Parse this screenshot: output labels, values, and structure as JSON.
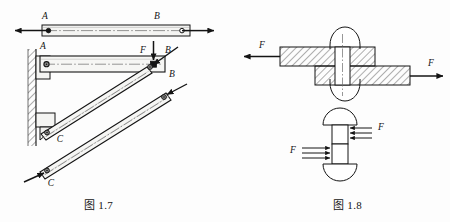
{
  "page": {
    "background": "#fdfdfd",
    "ink": "#141414"
  },
  "figures": [
    {
      "id": "fig-1-7",
      "caption": "图 1.7",
      "description": "two-force-member-and-wall-bracket",
      "labels": {
        "top_bar_left": "A",
        "top_bar_right": "B",
        "bracket_pin_a": "A",
        "bracket_force": "F",
        "bracket_pin_b": "B",
        "strut_upper_c": "C",
        "strut_upper_b": "B",
        "strut_lower_c": "C"
      }
    },
    {
      "id": "fig-1-8",
      "caption": "图 1.8",
      "description": "riveted-lap-joint-and-rivet-shear",
      "labels": {
        "joint_force_left": "F",
        "joint_force_right": "F",
        "rivet_force_upper": "F",
        "rivet_force_lower": "F"
      }
    }
  ],
  "colors": {
    "line": "#141414",
    "hatch": "#2b2b2b",
    "fill_light": "#f4f4f2",
    "fill_shade": "#e8e8e6",
    "centerline": "#6b6b6b"
  }
}
